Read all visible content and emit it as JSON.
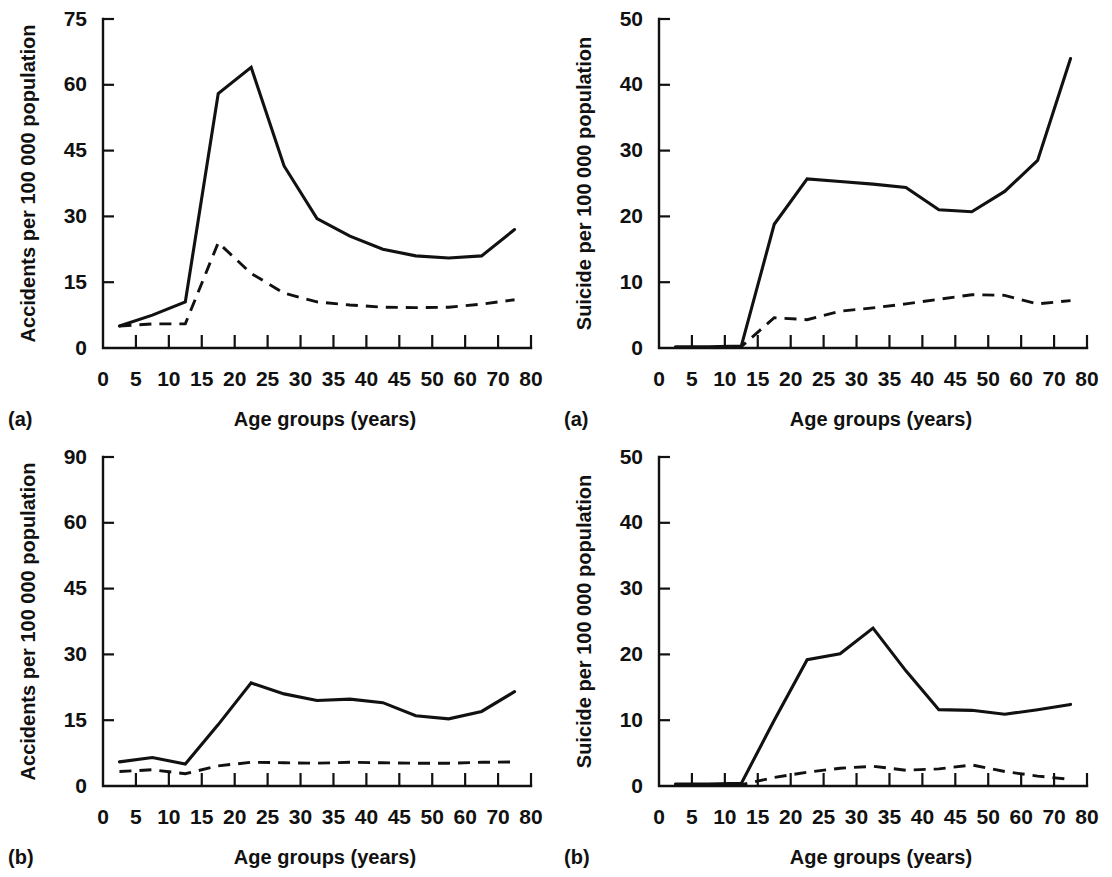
{
  "figure": {
    "layout": "2x2 grid of line charts",
    "shared_xlabel": "Age groups (years)",
    "x_tick_labels": [
      "0",
      "5",
      "10",
      "15",
      "20",
      "25",
      "30",
      "35",
      "40",
      "45",
      "50",
      "60",
      "70",
      "80"
    ],
    "series_styles": [
      "solid",
      "dashed"
    ]
  },
  "panels": [
    {
      "id": "accidents-a",
      "letter": "(a)",
      "position": "top-left",
      "ylabel": "Accidents per 100 000 population",
      "xlabel": "Age groups (years)",
      "y_tick_labels": [
        "0",
        "15",
        "30",
        "45",
        "60",
        "75"
      ]
    },
    {
      "id": "suicide-a",
      "letter": "(a)",
      "position": "top-right",
      "ylabel": "Suicide per 100 000 population",
      "xlabel": "Age groups (years)",
      "y_tick_labels": [
        "0",
        "10",
        "20",
        "30",
        "40",
        "50"
      ]
    },
    {
      "id": "accidents-b",
      "letter": "(b)",
      "position": "bottom-left",
      "ylabel": "Accidents per 100 000 population",
      "xlabel": "Age groups (years)",
      "y_tick_labels": [
        "0",
        "15",
        "30",
        "45",
        "60",
        "90"
      ]
    },
    {
      "id": "suicide-b",
      "letter": "(b)",
      "position": "bottom-right",
      "ylabel": "Suicide per 100 000 population",
      "xlabel": "Age groups (years)",
      "y_tick_labels": [
        "0",
        "10",
        "20",
        "30",
        "40",
        "50"
      ]
    }
  ],
  "chart_data": [
    {
      "id": "accidents-a",
      "type": "line",
      "title": "",
      "panel_label": "(a)",
      "xlabel": "Age groups (years)",
      "ylabel": "Accidents per 100 000 population",
      "grid": false,
      "legend": "none",
      "xlim": [
        0,
        80
      ],
      "x_ticks": [
        0,
        5,
        10,
        15,
        20,
        25,
        30,
        35,
        40,
        45,
        50,
        60,
        70,
        80
      ],
      "x_tick_spacing": "categorical-even",
      "ylim": [
        0,
        75
      ],
      "y_ticks": [
        0,
        15,
        30,
        45,
        60,
        75
      ],
      "x": [
        2.5,
        7.5,
        12.5,
        17.5,
        22.5,
        27.5,
        32.5,
        37.5,
        42.5,
        47.5,
        55,
        65,
        75
      ],
      "series": [
        {
          "name": "solid",
          "style": "solid",
          "values": [
            5.0,
            7.5,
            10.5,
            58.0,
            64.0,
            41.5,
            29.5,
            25.5,
            22.5,
            21.0,
            20.5,
            21.0,
            27.0
          ]
        },
        {
          "name": "dashed",
          "style": "dashed",
          "values": [
            5.0,
            5.5,
            5.5,
            24.0,
            17.0,
            12.5,
            10.5,
            9.8,
            9.3,
            9.2,
            9.3,
            10.0,
            11.0
          ]
        }
      ]
    },
    {
      "id": "suicide-a",
      "type": "line",
      "title": "",
      "panel_label": "(a)",
      "xlabel": "Age groups (years)",
      "ylabel": "Suicide per 100 000 population",
      "grid": false,
      "legend": "none",
      "xlim": [
        0,
        80
      ],
      "x_ticks": [
        0,
        5,
        10,
        15,
        20,
        25,
        30,
        35,
        40,
        45,
        50,
        60,
        70,
        80
      ],
      "x_tick_spacing": "categorical-even",
      "ylim": [
        0,
        50
      ],
      "y_ticks": [
        0,
        10,
        20,
        30,
        40,
        50
      ],
      "x": [
        2.5,
        7.5,
        12.5,
        17.5,
        22.5,
        27.5,
        32.5,
        37.5,
        42.5,
        47.5,
        55,
        65,
        75
      ],
      "series": [
        {
          "name": "solid",
          "style": "solid",
          "values": [
            0.2,
            0.2,
            0.3,
            18.8,
            25.7,
            25.3,
            24.9,
            24.4,
            21.0,
            20.7,
            23.8,
            28.5,
            44.0
          ]
        },
        {
          "name": "dashed",
          "style": "dashed",
          "values": [
            0.1,
            0.1,
            0.2,
            4.6,
            4.3,
            5.6,
            6.1,
            6.7,
            7.4,
            8.1,
            8.0,
            6.7,
            7.2
          ]
        }
      ]
    },
    {
      "id": "accidents-b",
      "type": "line",
      "title": "",
      "panel_label": "(b)",
      "xlabel": "Age groups (years)",
      "ylabel": "Accidents per 100 000 population",
      "grid": false,
      "legend": "none",
      "xlim": [
        0,
        80
      ],
      "x_ticks": [
        0,
        5,
        10,
        15,
        20,
        25,
        30,
        35,
        40,
        45,
        50,
        60,
        70,
        80
      ],
      "x_tick_spacing": "categorical-even",
      "ylim": [
        0,
        90
      ],
      "y_ticks": [
        0,
        15,
        30,
        45,
        60,
        90
      ],
      "y_tick_spacing": "categorical-even",
      "x": [
        2.5,
        7.5,
        12.5,
        17.5,
        22.5,
        27.5,
        32.5,
        37.5,
        42.5,
        47.5,
        55,
        65,
        75
      ],
      "series": [
        {
          "name": "solid",
          "style": "solid",
          "values": [
            5.5,
            6.5,
            5.0,
            14.0,
            23.5,
            21.0,
            19.5,
            19.8,
            19.0,
            16.0,
            15.3,
            17.0,
            21.5
          ]
        },
        {
          "name": "dashed",
          "style": "dashed",
          "values": [
            3.3,
            3.7,
            2.8,
            4.6,
            5.4,
            5.3,
            5.2,
            5.4,
            5.3,
            5.2,
            5.2,
            5.4,
            5.5
          ]
        }
      ]
    },
    {
      "id": "suicide-b",
      "type": "line",
      "title": "",
      "panel_label": "(b)",
      "xlabel": "Age groups (years)",
      "ylabel": "Suicide per 100 000 population",
      "grid": false,
      "legend": "none",
      "xlim": [
        0,
        80
      ],
      "x_ticks": [
        0,
        5,
        10,
        15,
        20,
        25,
        30,
        35,
        40,
        45,
        50,
        60,
        70,
        80
      ],
      "x_tick_spacing": "categorical-even",
      "ylim": [
        0,
        50
      ],
      "y_ticks": [
        0,
        10,
        20,
        30,
        40,
        50
      ],
      "x": [
        2.5,
        7.5,
        12.5,
        17.5,
        22.5,
        27.5,
        32.5,
        37.5,
        42.5,
        47.5,
        55,
        65,
        75
      ],
      "series": [
        {
          "name": "solid",
          "style": "solid",
          "values": [
            0.3,
            0.3,
            0.4,
            10.0,
            19.2,
            20.1,
            24.0,
            17.5,
            11.6,
            11.5,
            10.9,
            11.6,
            12.4
          ]
        },
        {
          "name": "dashed",
          "style": "dashed",
          "values": [
            0.1,
            0.1,
            0.2,
            1.3,
            2.1,
            2.7,
            3.0,
            2.4,
            2.6,
            3.2,
            2.2,
            1.5,
            1.0
          ]
        }
      ]
    }
  ]
}
